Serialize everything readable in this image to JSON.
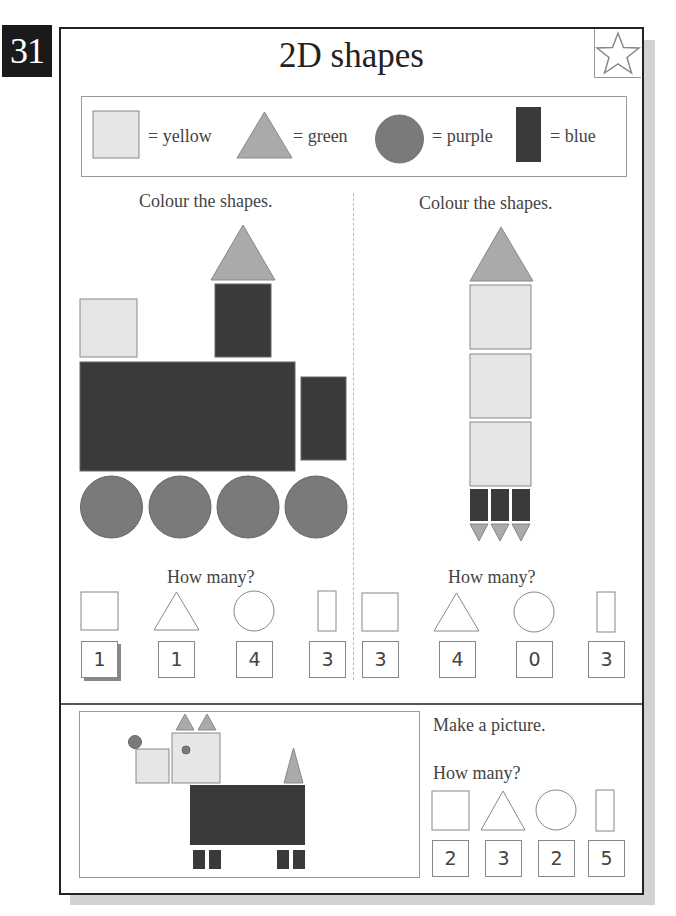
{
  "page": {
    "number": "31",
    "title": "2D shapes",
    "star_icon": "star-icon"
  },
  "colors": {
    "yellow_shade": "#e6e6e6",
    "green_shade": "#aaaaaa",
    "purple_shade": "#7a7a7a",
    "blue_shade": "#3a3a3a",
    "outline": "#888888",
    "shadow": "#d2d2d2"
  },
  "legend": {
    "items": [
      {
        "shape": "square",
        "label": "= yellow"
      },
      {
        "shape": "triangle",
        "label": "= green"
      },
      {
        "shape": "circle",
        "label": "= purple"
      },
      {
        "shape": "rectangle",
        "label": "= blue"
      }
    ]
  },
  "left_activity": {
    "instruction": "Colour the shapes.",
    "picture": "train",
    "how_many_label": "How many?",
    "answers": [
      {
        "shape": "square",
        "value": "1"
      },
      {
        "shape": "triangle",
        "value": "1"
      },
      {
        "shape": "circle",
        "value": "4"
      },
      {
        "shape": "rectangle",
        "value": "3"
      }
    ]
  },
  "right_activity": {
    "instruction": "Colour the shapes.",
    "picture": "rocket",
    "how_many_label": "How many?",
    "answers": [
      {
        "shape": "square",
        "value": "3"
      },
      {
        "shape": "triangle",
        "value": "4"
      },
      {
        "shape": "circle",
        "value": "0"
      },
      {
        "shape": "rectangle",
        "value": "3"
      }
    ]
  },
  "bottom_activity": {
    "instruction": "Make a picture.",
    "picture": "dog",
    "how_many_label": "How many?",
    "answers": [
      {
        "shape": "square",
        "value": "2"
      },
      {
        "shape": "triangle",
        "value": "3"
      },
      {
        "shape": "circle",
        "value": "2"
      },
      {
        "shape": "rectangle",
        "value": "5"
      }
    ]
  }
}
